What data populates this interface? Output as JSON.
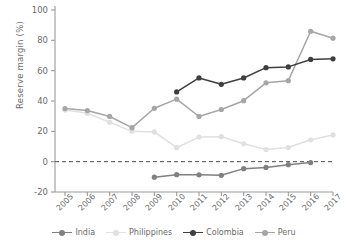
{
  "chart_data": {
    "type": "line",
    "title": "",
    "xlabel": "",
    "ylabel": "Reserve margin (%)",
    "categories": [
      "2005",
      "2006",
      "2007",
      "2008",
      "2009",
      "2010",
      "2011",
      "2012",
      "2013",
      "2014",
      "2015",
      "2016",
      "2017"
    ],
    "ylim": [
      -20,
      100
    ],
    "yticks": [
      -20,
      0,
      20,
      40,
      60,
      80,
      100
    ],
    "ytick_labels": [
      "-20",
      "0",
      "20",
      "40",
      "60",
      "80",
      "100"
    ],
    "grid": false,
    "legend_position": "bottom",
    "zero_reference_line": 0,
    "series": [
      {
        "name": "India",
        "color": "#808080",
        "values": [
          null,
          null,
          null,
          null,
          -10.2,
          -8.6,
          -8.7,
          -9.0,
          -4.6,
          -3.8,
          -2.0,
          -0.6,
          null
        ]
      },
      {
        "name": "Philippines",
        "color": "#e0e0e0",
        "values": [
          34.0,
          32.0,
          26.0,
          20.0,
          19.6,
          9.2,
          16.2,
          16.5,
          11.8,
          8.0,
          9.3,
          14.4,
          17.6
        ]
      },
      {
        "name": "Colombia",
        "color": "#3f3f3f",
        "values": [
          null,
          null,
          null,
          null,
          null,
          46.0,
          55.2,
          51.0,
          55.2,
          62.0,
          62.5,
          67.4,
          67.8
        ]
      },
      {
        "name": "Peru",
        "color": "#a6a6a6",
        "values": [
          35.0,
          33.7,
          29.8,
          22.4,
          35.2,
          41.2,
          29.8,
          34.4,
          40.2,
          52.0,
          53.4,
          86.0,
          81.4
        ]
      }
    ]
  },
  "legend": {
    "items": [
      {
        "label": "India",
        "color": "#808080"
      },
      {
        "label": "Philippines",
        "color": "#e0e0e0"
      },
      {
        "label": "Colombia",
        "color": "#3f3f3f"
      },
      {
        "label": "Peru",
        "color": "#a6a6a6"
      }
    ]
  },
  "axis": {
    "spine_color": "#9a9a9a",
    "zero_line_color": "#4d4d4d",
    "tick_color": "#9a9a9a"
  }
}
